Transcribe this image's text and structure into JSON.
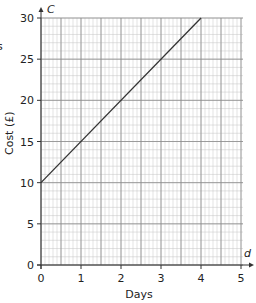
{
  "chart_data": {
    "type": "line",
    "title": "",
    "xlabel": "Days",
    "ylabel": "Cost (£)",
    "x_var": "d",
    "y_var": "C",
    "xlim": [
      0,
      5
    ],
    "ylim": [
      0,
      30
    ],
    "x_ticks": [
      0,
      1,
      2,
      3,
      4,
      5
    ],
    "y_ticks": [
      0,
      5,
      10,
      15,
      20,
      25,
      30
    ],
    "x_tick_labels": [
      "0",
      "1",
      "2",
      "3",
      "4",
      "5"
    ],
    "y_tick_labels": [
      "0",
      "5",
      "10",
      "15",
      "20",
      "25",
      "30"
    ],
    "grid": true,
    "grid_minor_x_step": 0.1,
    "grid_minor_y_step": 1,
    "grid_major_x_step": 0.5,
    "grid_major_y_step": 5,
    "series": [
      {
        "name": "Cost",
        "x": [
          0,
          4
        ],
        "y": [
          10,
          30
        ],
        "color": "#333333"
      }
    ],
    "partial_label": "s"
  }
}
